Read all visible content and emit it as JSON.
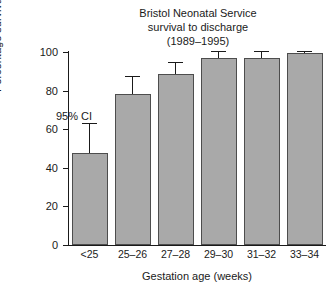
{
  "chart_data": {
    "type": "bar",
    "title": "Bristol Neonatal Service survival to discharge (1989–1995)",
    "title_lines": [
      "Bristol Neonatal Service",
      "survival to discharge",
      "(1989–1995)"
    ],
    "xlabel": "Gestation age (weeks)",
    "ylabel": "Percentage survival",
    "categories": [
      "<25",
      "25–26",
      "27–28",
      "29–30",
      "31–32",
      "33–34"
    ],
    "values": [
      47.5,
      78,
      88.5,
      97,
      97,
      99.3
    ],
    "error_upper": [
      63,
      87.5,
      95,
      100.5,
      100.5,
      100.5
    ],
    "error_lower": [
      32,
      68.5,
      82,
      93.5,
      93.5,
      98
    ],
    "error_type": "95% CI",
    "ylim": [
      0,
      100
    ],
    "yticks": [
      0,
      20,
      40,
      60,
      80,
      100
    ],
    "ytick_labels": [
      "0",
      "20",
      "40",
      "60",
      "80",
      "100"
    ],
    "grid": false,
    "legend": false,
    "annotations": [
      {
        "text": "95% CI",
        "near_category": "<25"
      }
    ],
    "bar_color": "#a9a9a9",
    "bar_edge_color": "#4d4d4d",
    "axis_color": "#1a1a1a"
  }
}
